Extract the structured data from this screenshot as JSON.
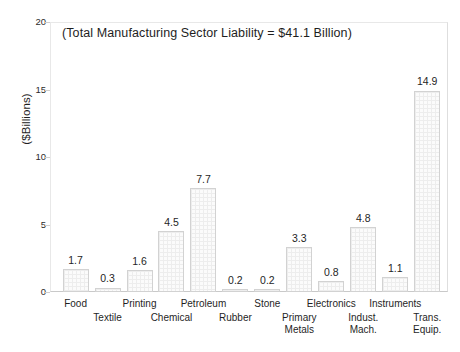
{
  "chart_data": {
    "type": "bar",
    "title": "",
    "subtitle": "",
    "annotation": "(Total Manufacturing Sector Liability = $41.1 Billion)",
    "xlabel": "",
    "ylabel": "($Billions)",
    "ylim": [
      0,
      20
    ],
    "yticks": [
      0,
      5,
      10,
      15,
      20
    ],
    "ytick_labels": [
      "0",
      "5",
      "10",
      "15",
      "20"
    ],
    "grid": false,
    "legend": false,
    "categories": [
      "Food",
      "Textile",
      "Printing",
      "Chemical",
      "Petroleum",
      "Rubber",
      "Stone",
      "Primary Metals",
      "Electronics",
      "Indust. Mach.",
      "Instruments",
      "Trans. Equip."
    ],
    "category_lines": [
      [
        "Food"
      ],
      [
        "Textile"
      ],
      [
        "Printing"
      ],
      [
        "Chemical"
      ],
      [
        "Petroleum"
      ],
      [
        "Rubber"
      ],
      [
        "Stone"
      ],
      [
        "Primary",
        "Metals"
      ],
      [
        "Electronics"
      ],
      [
        "Indust.",
        "Mach."
      ],
      [
        "Instruments"
      ],
      [
        "Trans.",
        "Equip."
      ]
    ],
    "label_rows": [
      "top",
      "bottom",
      "top",
      "bottom",
      "top",
      "bottom",
      "top",
      "bottom",
      "top",
      "bottom",
      "top",
      "bottom"
    ],
    "values": [
      1.7,
      0.3,
      1.6,
      4.5,
      7.7,
      0.2,
      0.2,
      3.3,
      0.8,
      4.8,
      1.1,
      14.9
    ],
    "value_labels": [
      "1.7",
      "0.3",
      "1.6",
      "4.5",
      "7.7",
      "0.2",
      "0.2",
      "3.3",
      "0.8",
      "4.8",
      "1.1",
      "14.9"
    ],
    "colors": {
      "bar_fill": "#fbfbfb",
      "bar_hatch": "#ededed",
      "bar_edge": "#d2d2d2",
      "axis": "#cfcfcf",
      "frame": "#e3e3e3",
      "text": "#1f1f1f",
      "background": "#ffffff"
    }
  }
}
